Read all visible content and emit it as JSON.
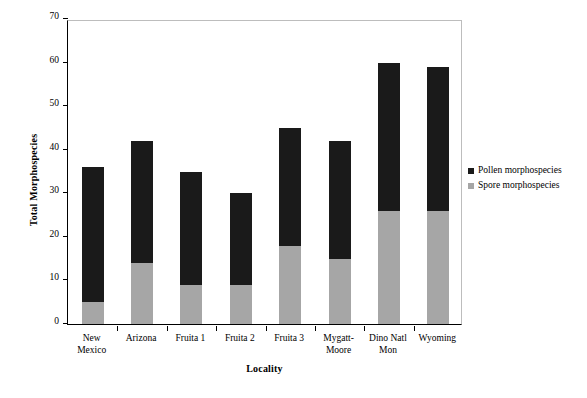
{
  "chart_data": {
    "type": "bar",
    "subtype": "stacked-vertical",
    "title": "",
    "xlabel": "Locality",
    "ylabel": "Total Morphospecies",
    "ylim": [
      0,
      70
    ],
    "yticks": [
      0,
      10,
      20,
      30,
      40,
      50,
      60,
      70
    ],
    "grid": false,
    "legend_position": "right",
    "categories": [
      "New\nMexico",
      "Arizona",
      "Fruita 1",
      "Fruita 2",
      "Fruita 3",
      "Mygatt-\nMoore",
      "Dino Natl\nMon",
      "Wyoming"
    ],
    "series": [
      {
        "name": "Spore morphospecies",
        "color": "#a6a6a6",
        "values": [
          5,
          14,
          9,
          9,
          18,
          15,
          26,
          26
        ]
      },
      {
        "name": "Pollen morphospecies",
        "color": "#1a1a1a",
        "values": [
          31,
          28,
          26,
          21,
          27,
          27,
          34,
          33
        ]
      }
    ],
    "totals": [
      36,
      42,
      35,
      30,
      45,
      42,
      60,
      59
    ]
  },
  "legend": {
    "items": [
      {
        "label": "Pollen morphospecies",
        "color": "#1a1a1a",
        "icon": "square-marker-icon"
      },
      {
        "label": "Spore morphospecies",
        "color": "#a6a6a6",
        "icon": "square-marker-icon"
      }
    ]
  },
  "axes": {
    "y_title": "Total Morphospecies",
    "x_title": "Locality",
    "y_tick_labels": [
      "0",
      "10",
      "20",
      "30",
      "40",
      "50",
      "60",
      "70"
    ]
  }
}
